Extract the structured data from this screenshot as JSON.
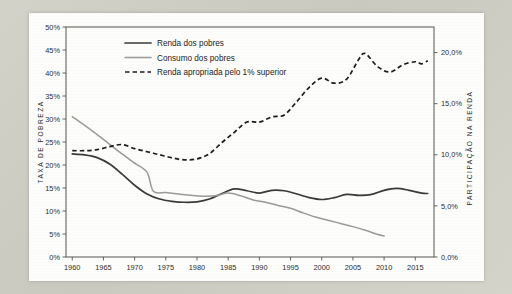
{
  "chart_data": {
    "type": "line",
    "title": "",
    "xlabel": "",
    "ylabel": "TAXA DE POBREZA",
    "y2label": "PARTICIPAÇÃO NA RENDA",
    "grid": false,
    "legend_position": "top-left-inside",
    "xlim": [
      1959,
      2018
    ],
    "xticks": [
      1960,
      1965,
      1970,
      1975,
      1980,
      1985,
      1990,
      1995,
      2000,
      2005,
      2010,
      2015
    ],
    "xticklabels": [
      "1960",
      "1965",
      "1970",
      "1975",
      "1980",
      "1985",
      "1990",
      "1995",
      "2000",
      "2005",
      "2010",
      "2015"
    ],
    "ylim": [
      0,
      50
    ],
    "yticks": [
      0,
      5,
      10,
      15,
      20,
      25,
      30,
      35,
      40,
      45,
      50
    ],
    "yticklabels": [
      "0%",
      "5%",
      "10%",
      "15%",
      "20%",
      "25%",
      "30%",
      "35%",
      "40%",
      "45%",
      "50%"
    ],
    "y2lim": [
      0,
      22.5
    ],
    "y2ticks": [
      0,
      5,
      10,
      15,
      20
    ],
    "y2ticklabels": [
      "0,0%",
      "5,0%",
      "10,0%",
      "15,0%",
      "20,0%"
    ],
    "series": [
      {
        "name": "Renda dos pobres",
        "axis": "left",
        "style": "solid",
        "color": "#3a3a38",
        "x": [
          1960,
          1962,
          1964,
          1966,
          1968,
          1970,
          1972,
          1974,
          1976,
          1978,
          1980,
          1982,
          1984,
          1986,
          1988,
          1990,
          1992,
          1994,
          1996,
          1998,
          2000,
          2002,
          2004,
          2006,
          2008,
          2010,
          2012,
          2014,
          2016,
          2017
        ],
        "y": [
          22.4,
          22.2,
          21.6,
          20.2,
          18.0,
          15.6,
          13.7,
          12.6,
          12.1,
          11.9,
          12.0,
          12.6,
          13.8,
          14.8,
          14.4,
          13.9,
          14.5,
          14.4,
          13.7,
          12.9,
          12.5,
          12.9,
          13.6,
          13.4,
          13.6,
          14.5,
          14.9,
          14.5,
          13.9,
          13.8
        ]
      },
      {
        "name": "Consumo dos pobres",
        "axis": "left",
        "style": "solid",
        "color": "#9a9a96",
        "x": [
          1960,
          1962,
          1964,
          1966,
          1968,
          1970,
          1972,
          1973,
          1975,
          1977,
          1979,
          1981,
          1983,
          1985,
          1987,
          1989,
          1991,
          1993,
          1995,
          1997,
          1999,
          2001,
          2003,
          2005,
          2007,
          2009,
          2010
        ],
        "y": [
          30.5,
          28.6,
          26.6,
          24.5,
          22.4,
          20.4,
          18.4,
          14.3,
          14.0,
          13.7,
          13.4,
          13.2,
          13.3,
          13.9,
          13.3,
          12.4,
          11.9,
          11.2,
          10.6,
          9.6,
          8.7,
          8.0,
          7.3,
          6.6,
          5.8,
          4.9,
          4.6
        ]
      },
      {
        "name": "Renda apropriada pelo 1% superior",
        "axis": "right",
        "style": "dashed",
        "color": "#1c1c1c",
        "x": [
          1960,
          1962,
          1964,
          1966,
          1968,
          1970,
          1972,
          1974,
          1976,
          1978,
          1980,
          1982,
          1984,
          1986,
          1988,
          1990,
          1992,
          1994,
          1996,
          1998,
          2000,
          2002,
          2004,
          2006,
          2007,
          2009,
          2011,
          2013,
          2015,
          2016,
          2017
        ],
        "y": [
          10.4,
          10.4,
          10.5,
          10.8,
          11.0,
          10.6,
          10.3,
          10.0,
          9.7,
          9.5,
          9.6,
          10.1,
          11.2,
          12.2,
          13.2,
          13.2,
          13.7,
          13.9,
          15.2,
          16.6,
          17.5,
          17.0,
          17.4,
          19.4,
          19.9,
          18.6,
          18.1,
          18.8,
          19.1,
          18.9,
          19.2
        ]
      }
    ]
  },
  "legend": {
    "items": [
      {
        "label": "Renda dos pobres",
        "marker": "solid-dark"
      },
      {
        "label": "Consumo dos pobres",
        "marker": "solid-gray"
      },
      {
        "label": "Renda apropriada pelo 1% superior",
        "marker": "dashed-dark"
      }
    ]
  },
  "colors": {
    "renda_pobres": "#3a3a38",
    "consumo_pobres": "#9a9a96",
    "renda_1pct": "#1c1c1c",
    "axis": "#555550",
    "page": "#fdfdfb",
    "frame": "#cfcfc6"
  }
}
